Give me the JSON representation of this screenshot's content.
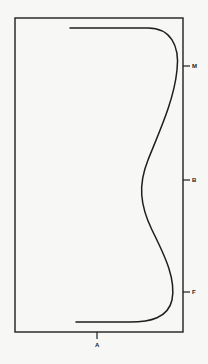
{
  "diagram": {
    "type": "profile-curve-in-frame",
    "colors": {
      "background": "#f7f7f5",
      "line": "#1e1e1e"
    },
    "frame": {
      "left": 15,
      "top": 18,
      "right": 183,
      "bottom": 332
    },
    "curve": {
      "description": "S-shaped profile curve starting at top-left, bulging to the right near M, indenting toward the center at B, bulging right again near F, ending at bottom-left",
      "path": "M 70 28 L 148 28 C 170 28 180 45 177 70 C 174 100 160 130 148 160 C 138 185 140 205 152 230 C 166 258 176 280 172 300 C 168 318 150 322 130 322 L 76 322"
    },
    "right_markers": [
      {
        "label": "M",
        "y": 66
      },
      {
        "label": "B",
        "y": 180
      },
      {
        "label": "F",
        "y": 292
      }
    ],
    "bottom_markers": [
      {
        "label": "A",
        "x": 97
      }
    ]
  }
}
